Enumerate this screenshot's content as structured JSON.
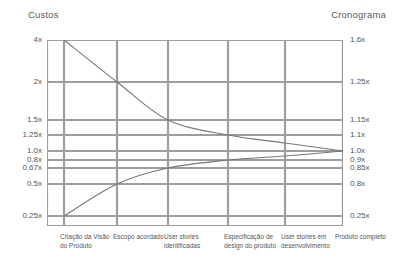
{
  "chart_data": {
    "type": "line",
    "title": "",
    "title_left": "Custos",
    "title_right": "Cronograma",
    "xlabel": "",
    "ylabel": "Custos",
    "y2label": "Cronograma",
    "grid": true,
    "legend": "none",
    "categories": [
      "Criação da Visão do Produto",
      "Escopo acordado",
      "User stories identificadas",
      "Especificação de design do produto",
      "User stories em desenvolvimento",
      "Produto completo"
    ],
    "y_left_ticks": [
      "4x",
      "2x",
      "1.5x",
      "1.25x",
      "1.0x",
      "0.8x",
      "0.67x",
      "0.5x",
      "0.25x"
    ],
    "y_right_ticks": [
      "1.6x",
      "1.25x",
      "1.15x",
      "1.1x",
      "1.0x",
      "0.9x",
      "0.85x",
      "0.8x",
      "0.25x"
    ],
    "series": [
      {
        "name": "upper-bound",
        "axis": "left",
        "values": [
          4,
          2,
          1.5,
          1.25,
          1.15,
          1.0
        ],
        "x_fractions": [
          0.0575,
          0.2365,
          0.4088,
          0.6115,
          0.8041,
          1.0
        ],
        "y_fractions": [
          0.0,
          0.2258,
          0.4301,
          0.5108,
          0.5538,
          0.5968
        ]
      },
      {
        "name": "lower-bound",
        "axis": "left",
        "values": [
          0.25,
          0.5,
          0.67,
          0.8,
          0.9,
          1.0
        ],
        "x_fractions": [
          0.0575,
          0.2365,
          0.4088,
          0.6115,
          0.8041,
          1.0
        ],
        "y_fractions": [
          0.9462,
          0.7742,
          0.6882,
          0.6452,
          0.6237,
          0.5968
        ]
      }
    ],
    "y_tick_fractions": [
      0.0,
      0.2258,
      0.4301,
      0.5108,
      0.5968,
      0.6452,
      0.6882,
      0.7742,
      0.9462
    ],
    "x_gridline_fractions": [
      0.0575,
      0.2365,
      0.4088,
      0.6115,
      0.8041,
      1.0
    ],
    "colors": {
      "grid": "#9e9e9e",
      "curve": "#777777",
      "text": "#555555",
      "background": "#ffffff"
    }
  }
}
